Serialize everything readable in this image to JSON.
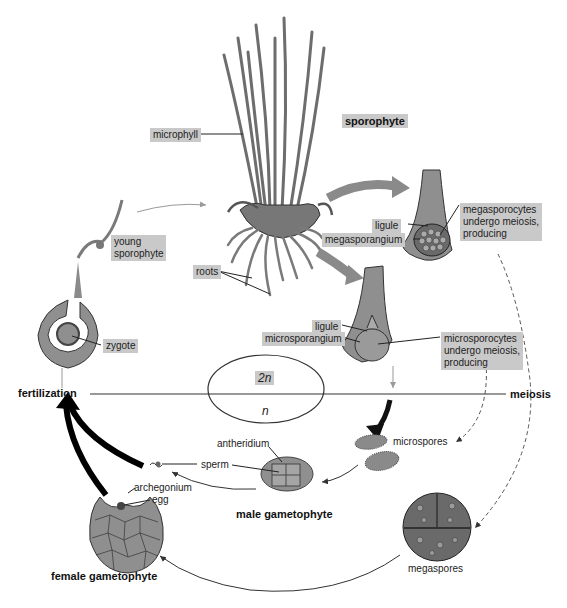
{
  "diagram": {
    "stages": {
      "sporophyte": "sporophyte",
      "male_gametophyte": "male gametophyte",
      "female_gametophyte": "female gametophyte",
      "fertilization": "fertilization",
      "meiosis": "meiosis"
    },
    "ploidy": {
      "diploid": "2n",
      "haploid": "n"
    },
    "labels": {
      "microphyll": "microphyll",
      "roots": "roots",
      "young_sporophyte": "young\nsporophyte",
      "zygote": "zygote",
      "ligule_mega": "ligule",
      "megasporangium": "megasporangium",
      "megasporocytes": "megasporocytes\nundergo meiosis,\nproducing",
      "ligule_micro": "ligule",
      "microsporangium": "microsporangium",
      "microsporocytes": "microsporocytes\nundergo meiosis,\nproducing",
      "microspores": "microspores",
      "megaspores": "megaspores",
      "antheridium": "antheridium",
      "sperm": "sperm",
      "archegonium": "archegonium",
      "egg": "egg"
    },
    "colors": {
      "label_box": "#c9c9c9",
      "tissue_gray": "#8f8f8f",
      "dark": "#111111",
      "arrow_gray": "#8a8a8a"
    }
  }
}
